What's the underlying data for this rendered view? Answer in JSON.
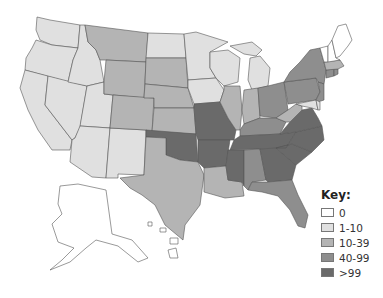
{
  "legend": {
    "title": "Key:",
    "items": [
      {
        "label": "0",
        "color": "#ffffff"
      },
      {
        "label": "1-10",
        "color": "#e0e0e0"
      },
      {
        "label": "10-39",
        "color": "#b4b4b4"
      },
      {
        "label": "40-99",
        "color": "#8e8e8e"
      },
      {
        "label": ">99",
        "color": "#6a6a6a"
      }
    ]
  },
  "states": {
    "WA": "1-10",
    "OR": "1-10",
    "CA": "1-10",
    "NV": "1-10",
    "ID": "1-10",
    "UT": "1-10",
    "AZ": "1-10",
    "NM": "1-10",
    "MT": "10-39",
    "WY": "10-39",
    "CO": "10-39",
    "ND": "1-10",
    "SD": "10-39",
    "NE": "10-39",
    "KS": "10-39",
    "OK": ">99",
    "TX": "10-39",
    "MN": "1-10",
    "IA": "1-10",
    "MO": ">99",
    "AR": ">99",
    "LA": "10-39",
    "WI": "1-10",
    "IL": "10-39",
    "MI": "1-10",
    "IN": "10-39",
    "OH": "40-99",
    "KY": "40-99",
    "TN": ">99",
    "MS": ">99",
    "AL": "40-99",
    "GA": ">99",
    "FL": "40-99",
    "SC": ">99",
    "NC": ">99",
    "VA": ">99",
    "WV": "10-39",
    "PA": "40-99",
    "NY": "40-99",
    "NJ": "40-99",
    "DE": "1-10",
    "MD": "1-10",
    "CT": "40-99",
    "RI": "40-99",
    "MA": "10-39",
    "VT": "0",
    "NH": "0",
    "ME": "0",
    "AK": "0",
    "HI": "0"
  }
}
